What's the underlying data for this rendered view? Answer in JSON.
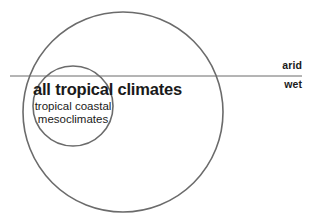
{
  "diagram": {
    "type": "venn-nested-circles",
    "background_color": "#ffffff",
    "stroke_color": "#6b6b6b",
    "text_color": "#1a1a1a",
    "outer_circle": {
      "label": "all tropical climates",
      "center_x": 123,
      "center_y": 112,
      "radius": 100,
      "stroke_width": 1.6
    },
    "inner_circle": {
      "label_line_1": "tropical coastal",
      "label_line_2": "mesoclimates",
      "center_x": 73,
      "center_y": 106,
      "radius": 40,
      "stroke_width": 1.6
    },
    "divider_line": {
      "label_above": "arid",
      "label_below": "wet",
      "x_start": 10,
      "x_end": 302,
      "y": 76,
      "stroke_width": 1
    }
  }
}
